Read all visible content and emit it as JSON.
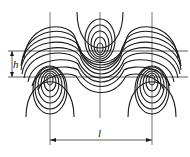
{
  "figure": {
    "type": "vortex street streamline diagram",
    "labels": {
      "h": "h",
      "l": "l"
    },
    "colors": {
      "line": "#1a1a1a",
      "background": "#ffffff"
    },
    "vortices": [
      {
        "position": "lower-left",
        "cx": 50,
        "cy": 77
      },
      {
        "position": "upper-center",
        "cx": 100,
        "cy": 52
      },
      {
        "position": "lower-right",
        "cx": 152,
        "cy": 77
      }
    ],
    "reference_lines_y": [
      51,
      77
    ],
    "dimension_l": {
      "x1": 50,
      "x2": 152,
      "y": 140
    }
  }
}
